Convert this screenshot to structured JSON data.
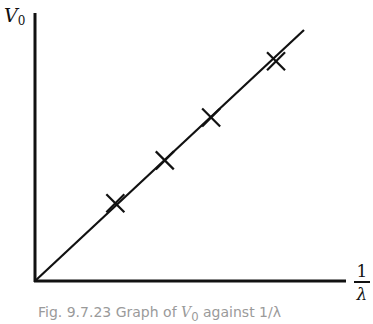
{
  "chart_data": {
    "type": "scatter",
    "title": "",
    "caption": "Fig. 9.7.23 Graph of V0 against 1/λ",
    "xlabel": "1/λ",
    "ylabel": "V0",
    "x_tick_labels": [],
    "y_tick_labels": [],
    "grid": false,
    "legend": null,
    "units": "arbitrary (no scale shown)",
    "xlim": [
      0,
      1.0
    ],
    "ylim": [
      0,
      1.0
    ],
    "series": [
      {
        "name": "measured points",
        "marker": "x",
        "x": [
          0.26,
          0.42,
          0.57,
          0.78
        ],
        "y": [
          0.29,
          0.45,
          0.61,
          0.82
        ]
      },
      {
        "name": "best-fit line",
        "style": "line",
        "x": [
          0.0,
          0.87
        ],
        "y": [
          0.0,
          0.95
        ]
      }
    ],
    "annotations": [
      "Straight line through origin"
    ]
  },
  "labels": {
    "y_axis_symbol": "V",
    "y_axis_subscript": "0",
    "x_axis_numerator": "1",
    "x_axis_denominator": "λ",
    "caption_prefix": "Fig. 9.7.23 Graph of ",
    "caption_symbol": "V",
    "caption_subscript": "0",
    "caption_suffix": " against 1/λ"
  },
  "colors": {
    "ink": "#111111",
    "caption": "#9a9a9a",
    "background": "#ffffff"
  }
}
